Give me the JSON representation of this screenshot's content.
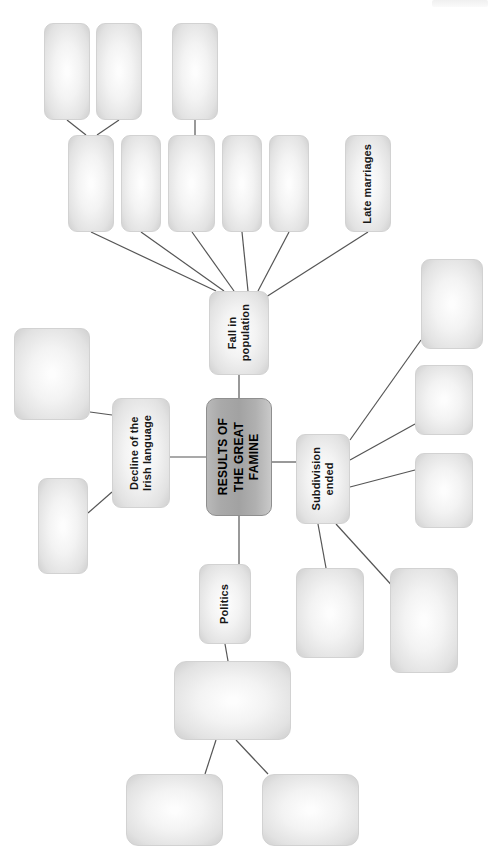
{
  "diagram": {
    "title": "RESULTS OF THE GREAT FAMINE",
    "type": "mind-map",
    "orientation": "rotated-90-ccw",
    "background_color": "#ffffff",
    "node_fill": "#eeeeee",
    "node_border_color": "#d2d2d2",
    "central_fill": "#a9a9a9",
    "connector_color": "#555555"
  },
  "nodes": {
    "central": {
      "id": "central",
      "label": "RESULTS OF\nTHE GREAT\nFAMINE",
      "x": 206,
      "y": 398,
      "w": 66,
      "h": 118
    },
    "fall_in_population": {
      "id": "fall-in-population",
      "label": "Fall in\npopulation",
      "x": 209,
      "y": 291,
      "w": 60,
      "h": 84
    },
    "decline_irish_language": {
      "id": "decline-of-the-irish-language",
      "label": "Decline of the\nIrish language",
      "x": 112,
      "y": 398,
      "w": 58,
      "h": 110
    },
    "subdivision_ended": {
      "id": "subdivision-ended",
      "label": "Subdivision\nended",
      "x": 296,
      "y": 434,
      "w": 54,
      "h": 90
    },
    "politics": {
      "id": "politics",
      "label": "Politics",
      "x": 199,
      "y": 564,
      "w": 52,
      "h": 80
    },
    "late_marriages": {
      "id": "late-marriages",
      "label": "Late marriages",
      "x": 345,
      "y": 135,
      "w": 46,
      "h": 97
    }
  },
  "blank_nodes": [
    {
      "id": "blank-top-1",
      "x": 44,
      "y": 23,
      "w": 46,
      "h": 97
    },
    {
      "id": "blank-top-2",
      "x": 96,
      "y": 23,
      "w": 46,
      "h": 97
    },
    {
      "id": "blank-top-3",
      "x": 172,
      "y": 23,
      "w": 46,
      "h": 97
    },
    {
      "id": "blank-row-1",
      "x": 68,
      "y": 135,
      "w": 46,
      "h": 97
    },
    {
      "id": "blank-row-2",
      "x": 121,
      "y": 135,
      "w": 40,
      "h": 97
    },
    {
      "id": "blank-row-3",
      "x": 168,
      "y": 135,
      "w": 47,
      "h": 97
    },
    {
      "id": "blank-row-4",
      "x": 222,
      "y": 135,
      "w": 40,
      "h": 97
    },
    {
      "id": "blank-row-5",
      "x": 269,
      "y": 135,
      "w": 40,
      "h": 97
    },
    {
      "id": "blank-left-upper",
      "x": 14,
      "y": 328,
      "w": 76,
      "h": 92
    },
    {
      "id": "blank-left-lower",
      "x": 38,
      "y": 478,
      "w": 50,
      "h": 96
    },
    {
      "id": "blank-right-1",
      "x": 421,
      "y": 259,
      "w": 62,
      "h": 90
    },
    {
      "id": "blank-right-2",
      "x": 415,
      "y": 365,
      "w": 58,
      "h": 70
    },
    {
      "id": "blank-right-3",
      "x": 415,
      "y": 453,
      "w": 58,
      "h": 75
    },
    {
      "id": "blank-lower-right-1",
      "x": 296,
      "y": 568,
      "w": 68,
      "h": 90
    },
    {
      "id": "blank-lower-right-2",
      "x": 390,
      "y": 568,
      "w": 68,
      "h": 105
    },
    {
      "id": "blank-politics-main",
      "x": 174,
      "y": 661,
      "w": 117,
      "h": 79
    },
    {
      "id": "blank-bottom-1",
      "x": 126,
      "y": 774,
      "w": 97,
      "h": 72
    },
    {
      "id": "blank-bottom-2",
      "x": 262,
      "y": 774,
      "w": 97,
      "h": 72
    }
  ],
  "connectors": [
    {
      "from": "central",
      "to": "fall-in-population",
      "x1": 239,
      "y1": 398,
      "x2": 239,
      "y2": 375
    },
    {
      "from": "central",
      "to": "decline-of-the-irish-language",
      "x1": 206,
      "y1": 457,
      "x2": 170,
      "y2": 457
    },
    {
      "from": "central",
      "to": "subdivision-ended",
      "x1": 272,
      "y1": 462,
      "x2": 296,
      "y2": 462
    },
    {
      "from": "central",
      "to": "politics",
      "x1": 239,
      "y1": 516,
      "x2": 239,
      "y2": 564
    },
    {
      "from": "fall-in-population",
      "to": "blank-row-1",
      "x1": 216,
      "y1": 291,
      "x2": 91,
      "y2": 232
    },
    {
      "from": "fall-in-population",
      "to": "blank-row-2",
      "x1": 224,
      "y1": 291,
      "x2": 141,
      "y2": 232
    },
    {
      "from": "fall-in-population",
      "to": "blank-row-3",
      "x1": 234,
      "y1": 291,
      "x2": 192,
      "y2": 232
    },
    {
      "from": "fall-in-population",
      "to": "blank-row-4",
      "x1": 248,
      "y1": 291,
      "x2": 242,
      "y2": 232
    },
    {
      "from": "fall-in-population",
      "to": "blank-row-5",
      "x1": 258,
      "y1": 291,
      "x2": 289,
      "y2": 232
    },
    {
      "from": "fall-in-population",
      "to": "late-marriages",
      "x1": 266,
      "y1": 297,
      "x2": 368,
      "y2": 232
    },
    {
      "from": "blank-row-1",
      "to": "blank-top-1",
      "x1": 86,
      "y1": 135,
      "x2": 67,
      "y2": 120
    },
    {
      "from": "blank-row-1",
      "to": "blank-top-2",
      "x1": 97,
      "y1": 135,
      "x2": 119,
      "y2": 120
    },
    {
      "from": "blank-row-3",
      "to": "blank-top-3",
      "x1": 195,
      "y1": 135,
      "x2": 195,
      "y2": 120
    },
    {
      "from": "decline-of-the-irish-language",
      "to": "blank-left-upper",
      "x1": 112,
      "y1": 415,
      "x2": 90,
      "y2": 412
    },
    {
      "from": "decline-of-the-irish-language",
      "to": "blank-left-lower",
      "x1": 112,
      "y1": 492,
      "x2": 88,
      "y2": 513
    },
    {
      "from": "subdivision-ended",
      "to": "blank-right-1",
      "x1": 350,
      "y1": 440,
      "x2": 421,
      "y2": 340
    },
    {
      "from": "subdivision-ended",
      "to": "blank-right-2",
      "x1": 350,
      "y1": 460,
      "x2": 415,
      "y2": 424
    },
    {
      "from": "subdivision-ended",
      "to": "blank-right-3",
      "x1": 350,
      "y1": 487,
      "x2": 415,
      "y2": 470
    },
    {
      "from": "subdivision-ended",
      "to": "blank-lower-right-1",
      "x1": 318,
      "y1": 524,
      "x2": 326,
      "y2": 568
    },
    {
      "from": "subdivision-ended",
      "to": "blank-lower-right-2",
      "x1": 336,
      "y1": 524,
      "x2": 396,
      "y2": 590
    },
    {
      "from": "politics",
      "to": "blank-politics-main",
      "x1": 225,
      "y1": 644,
      "x2": 228,
      "y2": 661
    },
    {
      "from": "blank-politics-main",
      "to": "blank-bottom-1",
      "x1": 216,
      "y1": 740,
      "x2": 205,
      "y2": 774
    },
    {
      "from": "blank-politics-main",
      "to": "blank-bottom-2",
      "x1": 236,
      "y1": 740,
      "x2": 268,
      "y2": 774
    }
  ],
  "artifact": {
    "x": 432,
    "y": 0,
    "w": 56,
    "h": 7
  }
}
